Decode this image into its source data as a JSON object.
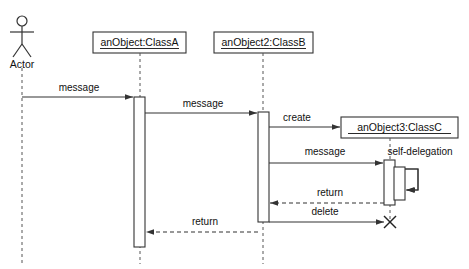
{
  "diagram": {
    "type": "uml-sequence-diagram",
    "width": 469,
    "height": 269,
    "background_color": "#ffffff",
    "line_color": "#333333",
    "lifeline_color": "#555555",
    "text_color": "#111111"
  },
  "participants": [
    {
      "id": "actor",
      "kind": "actor",
      "label": "Actor",
      "lifeline_x": 22,
      "lifeline_top": 68,
      "lifeline_bottom": 264
    },
    {
      "id": "objectA",
      "kind": "object",
      "label": "anObject:ClassA",
      "box": {
        "x": 93,
        "y": 32,
        "width": 93,
        "height": 21
      },
      "lifeline_x": 140,
      "lifeline_top": 53,
      "lifeline_bottom": 264
    },
    {
      "id": "objectB",
      "kind": "object",
      "label": "anObject2:ClassB",
      "box": {
        "x": 214,
        "y": 32,
        "width": 99,
        "height": 21
      },
      "lifeline_x": 263,
      "lifeline_top": 53,
      "lifeline_bottom": 264
    },
    {
      "id": "objectC",
      "kind": "object",
      "label": "anObject3:ClassC",
      "box": {
        "x": 341,
        "y": 117,
        "width": 117,
        "height": 21
      },
      "lifeline_x": 390,
      "lifeline_top": 138,
      "lifeline_bottom": 222
    }
  ],
  "activations": [
    {
      "id": "act-a",
      "owner": "objectA",
      "x": 134,
      "y": 97,
      "width": 11,
      "height": 150
    },
    {
      "id": "act-b",
      "owner": "objectB",
      "x": 258,
      "y": 112,
      "width": 11,
      "height": 110
    },
    {
      "id": "act-c-outer",
      "owner": "objectC",
      "x": 384,
      "y": 160,
      "width": 11,
      "height": 45
    },
    {
      "id": "act-c-inner",
      "owner": "objectC",
      "x": 394,
      "y": 167,
      "width": 11,
      "height": 33
    }
  ],
  "messages": [
    {
      "id": "msg-1",
      "label": "message",
      "style": "solid",
      "arrow": "filled",
      "from_x": 22,
      "to_x": 134,
      "y": 97,
      "label_x": 79,
      "label_y": 88
    },
    {
      "id": "msg-2",
      "label": "message",
      "style": "solid",
      "arrow": "filled",
      "from_x": 145,
      "to_x": 258,
      "y": 113,
      "label_x": 203,
      "label_y": 104
    },
    {
      "id": "msg-3-create",
      "label": "create",
      "style": "solid",
      "arrow": "filled",
      "from_x": 269,
      "to_x": 341,
      "y": 127,
      "label_x": 297,
      "label_y": 118
    },
    {
      "id": "msg-4",
      "label": "message",
      "style": "solid",
      "arrow": "filled",
      "from_x": 269,
      "to_x": 384,
      "y": 163,
      "label_x": 325,
      "label_y": 152
    },
    {
      "id": "msg-5-self",
      "label": "self-delegation",
      "style": "solid",
      "arrow": "filled",
      "self": true,
      "from_x": 405,
      "out_x": 418,
      "to_x": 405,
      "y_start": 167,
      "y_end": 190,
      "label_x": 420,
      "label_y": 152
    },
    {
      "id": "msg-6-return",
      "label": "return",
      "style": "dashed",
      "arrow": "open",
      "from_x": 384,
      "to_x": 269,
      "y": 203,
      "label_x": 330,
      "label_y": 193
    },
    {
      "id": "msg-7-delete",
      "label": "delete",
      "style": "solid",
      "arrow": "filled",
      "from_x": 269,
      "to_x": 385,
      "y": 222,
      "label_x": 325,
      "label_y": 212
    },
    {
      "id": "msg-8-return",
      "label": "return",
      "style": "dashed",
      "arrow": "open",
      "from_x": 258,
      "to_x": 145,
      "y": 232,
      "label_x": 205,
      "label_y": 222
    }
  ],
  "termination": {
    "id": "destroy-objectC",
    "symbol": "X",
    "x": 390,
    "y": 222,
    "size": 7
  }
}
